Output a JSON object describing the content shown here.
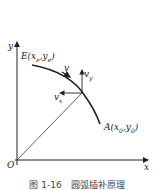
{
  "figure": {
    "labels": {
      "y_axis": "y",
      "x_axis": "x",
      "origin": "O",
      "start_point": "E(x",
      "start_point_sub": "e",
      "start_point_mid": ",y",
      "start_point_sub2": "e",
      "start_point_end": ")",
      "end_point": "A(x",
      "end_point_sub": "0",
      "end_point_mid": ",y",
      "end_point_sub2": "0",
      "end_point_end": ")",
      "velocity": "v",
      "velocity_y": "v",
      "velocity_y_sub": "y",
      "velocity_x": "v",
      "velocity_x_sub": "x"
    },
    "caption": "图 1-16　圆弧插补原理",
    "stroke_color": "#222222"
  }
}
